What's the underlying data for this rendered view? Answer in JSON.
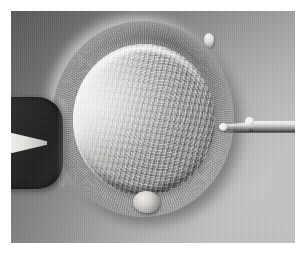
{
  "figure": {
    "kind": "photomicrograph",
    "modality": "differential-interference-contrast",
    "caption": "",
    "plate": {
      "left": 11,
      "top": 11,
      "width": 284,
      "height": 232,
      "page_background": "#ffffff"
    }
  },
  "colors": {
    "page_background": "#ffffff",
    "field_dark": "#5f6061",
    "field_mid": "#8a8b8c",
    "field_light": "#d0d1d1",
    "ooplasm_highlight": "#ebe9e6",
    "ooplasm_shadow": "#9d9b9a",
    "holding_pipette_dark": "#242425",
    "pipette_lumen_bright": "#f6f5f3",
    "needle_bright": "#ffffff",
    "needle_outline_dark": "#1e1e1e"
  },
  "structures": {
    "field": {
      "label": "culture medium field",
      "note": "DIC shading runs dark at upper-left to light at lower-right"
    },
    "zona_pellucida": {
      "label": "zona pellucida",
      "center_x": 132,
      "center_y": 108,
      "width": 182,
      "height": 196,
      "note": "radially striated glycoprotein coat surrounding the oocyte"
    },
    "ooplasm": {
      "label": "ooplasm",
      "center_x": 133,
      "center_y": 109,
      "width": 142,
      "height": 152,
      "note": "granular cytoplasm, bright relief crescent on the left"
    },
    "polar_body": {
      "label": "first polar body",
      "center_x": 135,
      "center_y": 191,
      "note": "small extruded body at the lower pole"
    },
    "holding_pipette": {
      "label": "holding pipette",
      "side": "left",
      "note": "blunt suction pipette, out of focus and dark, bright wedge-shaped lumen"
    },
    "injection_pipette": {
      "label": "injection micropipette",
      "side": "right",
      "tip_x": 212,
      "tip_y": 116,
      "note": "fine bevelled needle approaching the zona from the right"
    },
    "debris_particle": {
      "label": "debris particle",
      "center_x": 198,
      "center_y": 29
    }
  }
}
